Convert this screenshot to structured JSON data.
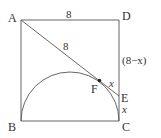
{
  "diagram": {
    "type": "geometry",
    "colors": {
      "stroke": "#555555",
      "text": "#333333",
      "background": "#ffffff"
    },
    "points": {
      "A": {
        "label": "A",
        "x": 21,
        "y": 20
      },
      "D": {
        "label": "D",
        "x": 119,
        "y": 20
      },
      "B": {
        "label": "B",
        "x": 21,
        "y": 121
      },
      "C": {
        "label": "C",
        "x": 119,
        "y": 121
      },
      "E": {
        "label": "E",
        "x": 119,
        "y": 96
      },
      "F": {
        "label": "F",
        "x": 100,
        "y": 81
      }
    },
    "labels": {
      "AD_length": "8",
      "AF_length": "8",
      "DE_length": "(8−x)",
      "FE_length": "x",
      "EC_length": "x"
    }
  }
}
